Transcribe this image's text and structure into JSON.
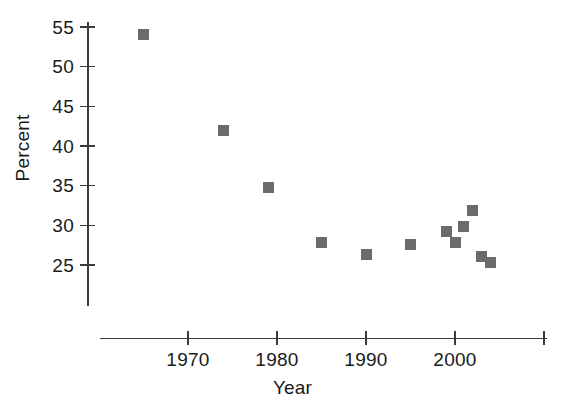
{
  "chart_data": {
    "type": "scatter",
    "title": "",
    "xlabel": "Year",
    "ylabel": "Percent",
    "grid": false,
    "legend": null,
    "marker": {
      "shape": "square",
      "color": "#6b6b6b",
      "size_px": 11
    },
    "xlim": [
      1962,
      2012
    ],
    "ylim": [
      21,
      57
    ],
    "xticks": [
      1970,
      1980,
      1990,
      2000,
      2010
    ],
    "xtick_labels": [
      "1970",
      "1980",
      "1990",
      "2000",
      ""
    ],
    "yticks": [
      25,
      30,
      35,
      40,
      45,
      50,
      55
    ],
    "ytick_labels": [
      "25",
      "30",
      "35",
      "40",
      "45",
      "50",
      "55"
    ],
    "points": [
      {
        "x": 1965,
        "y": 54.0
      },
      {
        "x": 1974,
        "y": 42.0
      },
      {
        "x": 1979,
        "y": 34.8
      },
      {
        "x": 1985,
        "y": 27.8
      },
      {
        "x": 1990,
        "y": 26.3
      },
      {
        "x": 1995,
        "y": 27.6
      },
      {
        "x": 1999,
        "y": 29.2
      },
      {
        "x": 2000,
        "y": 27.8
      },
      {
        "x": 2001,
        "y": 29.8
      },
      {
        "x": 2002,
        "y": 31.9
      },
      {
        "x": 2003,
        "y": 26.1
      },
      {
        "x": 2004,
        "y": 25.3
      }
    ]
  },
  "axes": {
    "y_title": "Percent",
    "x_title": "Year"
  },
  "colors": {
    "marker": "#6b6b6b",
    "axis": "#3a3a3a",
    "text": "#1a1a1a",
    "background": "#ffffff"
  }
}
